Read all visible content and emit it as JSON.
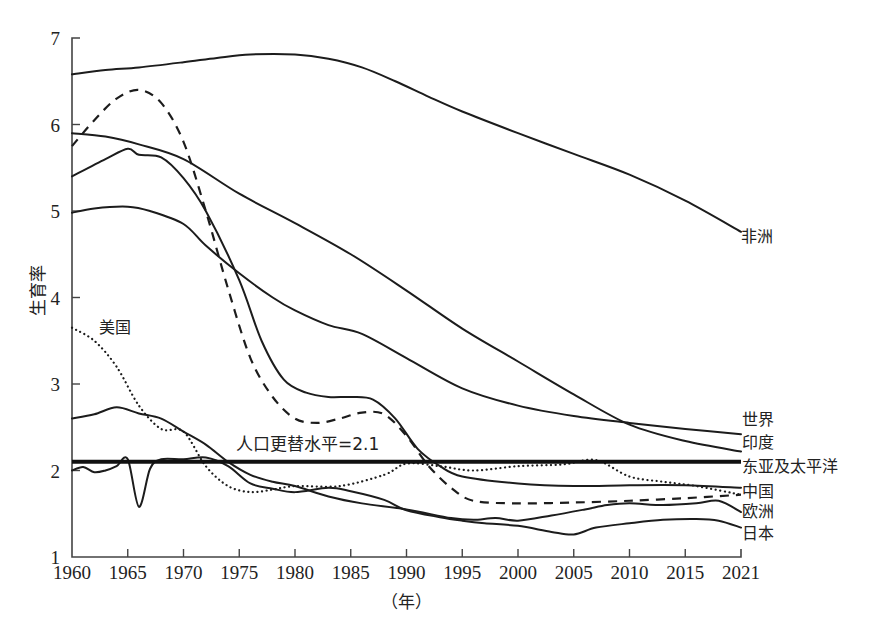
{
  "chart_data": {
    "type": "line",
    "title": "",
    "xlabel": "（年）",
    "ylabel": "生育率",
    "xlim": [
      1960,
      2020
    ],
    "ylim": [
      1,
      7
    ],
    "x_ticks": [
      1960,
      1965,
      1970,
      1975,
      1980,
      1985,
      1990,
      1995,
      2000,
      2005,
      2010,
      2015,
      2020
    ],
    "x_tick_labels": [
      "1960",
      "1965",
      "1970",
      "1975",
      "1980",
      "1985",
      "1990",
      "1995",
      "2000",
      "2005",
      "2010",
      "2015",
      "2021"
    ],
    "y_ticks": [
      1,
      2,
      3,
      4,
      5,
      6,
      7
    ],
    "grid": false,
    "annotations": [
      {
        "text": "人口更替水平=2.1",
        "x": 1975,
        "y": 2.25
      }
    ],
    "series": [
      {
        "name": "非洲",
        "style": "solid",
        "x": [
          1960,
          1963,
          1966,
          1970,
          1973,
          1976,
          1980,
          1983,
          1986,
          1989,
          1992,
          1995,
          2000,
          2005,
          2010,
          2015,
          2020
        ],
        "values": [
          6.58,
          6.63,
          6.66,
          6.72,
          6.77,
          6.81,
          6.81,
          6.76,
          6.66,
          6.5,
          6.32,
          6.15,
          5.9,
          5.66,
          5.42,
          5.12,
          4.76
        ]
      },
      {
        "name": "世界",
        "style": "solid",
        "x": [
          1960,
          1962,
          1965,
          1967,
          1970,
          1972,
          1975,
          1978,
          1980,
          1983,
          1986,
          1990,
          1995,
          2000,
          2005,
          2010,
          2015,
          2020
        ],
        "values": [
          4.98,
          5.03,
          5.05,
          5.0,
          4.85,
          4.6,
          4.28,
          4.0,
          3.85,
          3.68,
          3.58,
          3.3,
          2.95,
          2.75,
          2.63,
          2.55,
          2.48,
          2.42
        ]
      },
      {
        "name": "印度",
        "style": "solid",
        "x": [
          1960,
          1963,
          1966,
          1970,
          1975,
          1980,
          1985,
          1990,
          1995,
          2000,
          2005,
          2010,
          2015,
          2020
        ],
        "values": [
          5.9,
          5.86,
          5.77,
          5.6,
          5.2,
          4.86,
          4.5,
          4.08,
          3.64,
          3.26,
          2.88,
          2.53,
          2.34,
          2.22
        ]
      },
      {
        "name": "东亚及太平洋",
        "style": "solid",
        "x": [
          1960,
          1963,
          1965,
          1966,
          1968,
          1970,
          1972,
          1975,
          1977,
          1979,
          1981,
          1983,
          1985,
          1987,
          1989,
          1991,
          1993,
          1995,
          2000,
          2005,
          2010,
          2015,
          2020
        ],
        "values": [
          5.4,
          5.6,
          5.72,
          5.65,
          5.62,
          5.38,
          5.0,
          4.2,
          3.5,
          3.05,
          2.9,
          2.85,
          2.85,
          2.82,
          2.6,
          2.25,
          2.05,
          1.93,
          1.85,
          1.82,
          1.83,
          1.83,
          1.8
        ]
      },
      {
        "name": "中国",
        "style": "dashed",
        "x": [
          1960,
          1962,
          1964,
          1966,
          1968,
          1970,
          1972,
          1974,
          1976,
          1978,
          1980,
          1982,
          1984,
          1986,
          1988,
          1990,
          1992,
          1994,
          1996,
          2000,
          2005,
          2010,
          2015,
          2020
        ],
        "values": [
          5.75,
          6.05,
          6.3,
          6.4,
          6.25,
          5.8,
          5.0,
          4.1,
          3.3,
          2.85,
          2.6,
          2.55,
          2.6,
          2.67,
          2.65,
          2.4,
          2.05,
          1.8,
          1.65,
          1.62,
          1.63,
          1.65,
          1.68,
          1.72
        ]
      },
      {
        "name": "美国",
        "style": "dotted",
        "x": [
          1960,
          1962,
          1964,
          1966,
          1968,
          1970,
          1972,
          1974,
          1976,
          1978,
          1980,
          1984,
          1988,
          1990,
          1993,
          1996,
          2000,
          2004,
          2007,
          2010,
          2013,
          2016,
          2020
        ],
        "values": [
          3.65,
          3.5,
          3.2,
          2.75,
          2.48,
          2.45,
          2.05,
          1.82,
          1.75,
          1.78,
          1.82,
          1.82,
          1.95,
          2.08,
          2.05,
          2.0,
          2.05,
          2.07,
          2.12,
          1.93,
          1.87,
          1.82,
          1.72
        ]
      },
      {
        "name": "欧洲",
        "style": "solid",
        "x": [
          1960,
          1962,
          1964,
          1966,
          1968,
          1970,
          1972,
          1974,
          1976,
          1978,
          1980,
          1983,
          1986,
          1990,
          1994,
          1996,
          1998,
          2000,
          2003,
          2006,
          2008,
          2010,
          2013,
          2016,
          2018,
          2020
        ],
        "values": [
          2.6,
          2.65,
          2.73,
          2.66,
          2.6,
          2.45,
          2.3,
          2.1,
          1.95,
          1.87,
          1.82,
          1.7,
          1.62,
          1.55,
          1.45,
          1.43,
          1.45,
          1.42,
          1.48,
          1.55,
          1.6,
          1.62,
          1.6,
          1.62,
          1.65,
          1.52
        ]
      },
      {
        "name": "日本",
        "style": "solid",
        "x": [
          1960,
          1961,
          1962,
          1963,
          1964,
          1965,
          1966,
          1967,
          1968,
          1970,
          1972,
          1974,
          1976,
          1978,
          1980,
          1983,
          1985,
          1988,
          1990,
          1993,
          1995,
          1997,
          2000,
          2003,
          2005,
          2007,
          2010,
          2013,
          2016,
          2018,
          2020
        ],
        "values": [
          2.0,
          2.04,
          1.98,
          2.0,
          2.05,
          2.13,
          1.58,
          2.02,
          2.13,
          2.13,
          2.15,
          2.05,
          1.85,
          1.79,
          1.75,
          1.8,
          1.76,
          1.66,
          1.54,
          1.46,
          1.42,
          1.39,
          1.36,
          1.29,
          1.26,
          1.34,
          1.39,
          1.43,
          1.44,
          1.42,
          1.34
        ]
      },
      {
        "name": "人口更替水平",
        "style": "thick",
        "x": [
          1960,
          2020
        ],
        "values": [
          2.1,
          2.1
        ]
      }
    ]
  },
  "labels": {
    "ylabel": "生育率",
    "xlabel": "（年）",
    "replacement": "人口更替水平=2.1",
    "us": "美国",
    "africa": "非洲",
    "world": "世界",
    "india": "印度",
    "eap": "东亚及太平洋",
    "china": "中国",
    "europe": "欧洲",
    "japan": "日本"
  }
}
